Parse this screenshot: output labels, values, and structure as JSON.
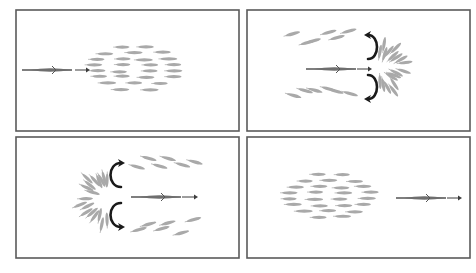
{
  "figure": {
    "colors": {
      "frame": "#5a5a5a",
      "prey": "#a9a9a9",
      "predator": "#6e6e6e",
      "curve_arrow": "#1a1a1a",
      "background": "#ffffff"
    },
    "panels": [
      {
        "id": "panel-1",
        "label": "predator approaching compact school",
        "frame": {
          "x": 16,
          "y": 10,
          "w": 223,
          "h": 121
        },
        "predator": {
          "x": 22,
          "y": 70,
          "len": 50,
          "dir": 1
        },
        "arrow": {
          "x1": 75,
          "x2": 90,
          "y": 70
        },
        "school": {
          "cx": 135,
          "cy": 68,
          "rx": 52,
          "ry": 24,
          "dir": 1
        },
        "split": false
      },
      {
        "id": "panel-2",
        "label": "school splits around predator",
        "frame": {
          "x": 247,
          "y": 10,
          "w": 223,
          "h": 121
        },
        "predator": {
          "x": 306,
          "y": 69,
          "len": 50,
          "dir": 1
        },
        "arrow": {
          "x1": 357,
          "x2": 372,
          "y": 69
        },
        "split": true,
        "split_side": "right",
        "center": {
          "x": 372,
          "y": 67
        }
      },
      {
        "id": "panel-3",
        "label": "school rejoins behind predator",
        "frame": {
          "x": 16,
          "y": 137,
          "w": 223,
          "h": 121
        },
        "predator": {
          "x": 131,
          "y": 197,
          "len": 50,
          "dir": 1
        },
        "arrow": {
          "x1": 182,
          "x2": 198,
          "y": 197
        },
        "split": true,
        "split_side": "left",
        "center": {
          "x": 115,
          "y": 195
        }
      },
      {
        "id": "panel-4",
        "label": "school reformed, predator moves away",
        "frame": {
          "x": 247,
          "y": 137,
          "w": 223,
          "h": 121
        },
        "predator": {
          "x": 396,
          "y": 198,
          "len": 50,
          "dir": 1
        },
        "arrow": {
          "x1": 447,
          "x2": 462,
          "y": 198
        },
        "school": {
          "cx": 330,
          "cy": 196,
          "rx": 52,
          "ry": 24,
          "dir": 1
        },
        "split": false
      }
    ]
  }
}
